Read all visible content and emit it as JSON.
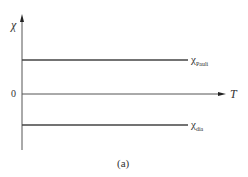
{
  "diagram": {
    "y_axis_label": "χ",
    "x_axis_label": "T",
    "origin_label": "0",
    "lines": [
      {
        "symbol": "χ",
        "subscript": "Pauli",
        "position": "above axis"
      },
      {
        "symbol": "χ",
        "subscript": "dia",
        "position": "below axis"
      }
    ],
    "caption": "(a)"
  },
  "colors": {
    "line": "#444444",
    "background": "#ffffff"
  }
}
